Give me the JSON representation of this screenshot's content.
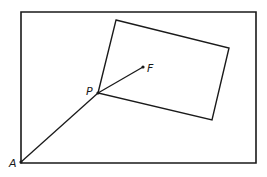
{
  "diagram": {
    "labels": {
      "A": "A",
      "P": "P",
      "F": "F"
    },
    "points": {
      "A": [
        21,
        162
      ],
      "P": [
        98,
        93
      ],
      "F": [
        143,
        67
      ]
    },
    "outer_rect": [
      [
        21,
        12
      ],
      [
        256,
        12
      ],
      [
        256,
        163
      ],
      [
        21,
        163
      ]
    ],
    "inner_rect": [
      [
        116,
        20
      ],
      [
        229,
        48
      ],
      [
        212,
        120
      ],
      [
        98,
        93
      ]
    ],
    "stroke_color": "#1a1a1a"
  }
}
